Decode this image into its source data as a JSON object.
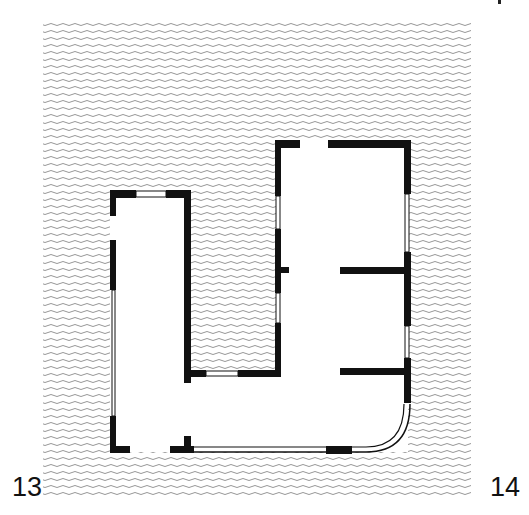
{
  "figure": {
    "type": "architectural floor plan",
    "labels": {
      "left": "13",
      "right": "14"
    },
    "colors": {
      "wall": "#111111",
      "hatch": "#8a8a8a",
      "background": "#ffffff",
      "window": "#ffffff"
    },
    "elements": [
      "hatched-ground",
      "left-wing",
      "right-block",
      "connecting-corridor",
      "inner-courtyard",
      "rounded-corner-window"
    ]
  }
}
